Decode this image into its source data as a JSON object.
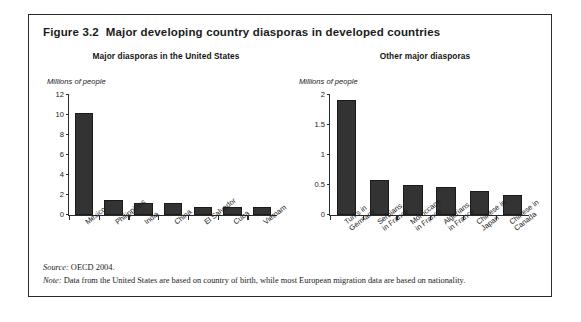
{
  "figure": {
    "number": "Figure 3.2",
    "title": "Major developing country diasporas in developed countries",
    "source_label": "Source:",
    "source_text": " OECD 2004.",
    "note_label": "Note:",
    "note_text": " Data from the United States are based on country of birth, while most European migration data are based on nationality.",
    "border_color": "#2b2b2b",
    "bar_color": "#333333"
  },
  "chart_data": [
    {
      "type": "bar",
      "title": "Major diasporas in the United States",
      "ylabel": "Millions of people",
      "xlabel": "",
      "ylim": [
        0,
        12
      ],
      "yticks": [
        0,
        2,
        4,
        6,
        8,
        10,
        12
      ],
      "ytick_labels": [
        "0",
        "2",
        "4",
        "6",
        "8",
        "10",
        "12"
      ],
      "grid": false,
      "legend": "none",
      "categories": [
        "Mexico",
        "Philippines",
        "India",
        "China",
        "El Salvador",
        "Cuba",
        "Vietnam"
      ],
      "values": [
        10.2,
        1.5,
        1.2,
        1.2,
        0.85,
        0.85,
        0.8
      ]
    },
    {
      "type": "bar",
      "title": "Other major diasporas",
      "ylabel": "Millions of people",
      "xlabel": "",
      "ylim": [
        0,
        2
      ],
      "yticks": [
        0,
        0.5,
        1,
        1.5,
        2
      ],
      "ytick_labels": [
        "0",
        "0.5",
        "1",
        "1.5",
        "2"
      ],
      "grid": false,
      "legend": "none",
      "categories": [
        "Turks in Germany",
        "Serbians in France",
        "Moroccans in France",
        "Algerians in France",
        "Chinese in Japan",
        "Chinese in Canada"
      ],
      "category_lines": [
        [
          "Turks in",
          "Germany"
        ],
        [
          "Serbians",
          "in France"
        ],
        [
          "Moroccans",
          "in France"
        ],
        [
          "Algerians",
          "in France"
        ],
        [
          "Chinese in",
          "Japan"
        ],
        [
          "Chinese in",
          "Canada"
        ]
      ],
      "values": [
        1.92,
        0.58,
        0.5,
        0.47,
        0.4,
        0.33
      ]
    }
  ]
}
